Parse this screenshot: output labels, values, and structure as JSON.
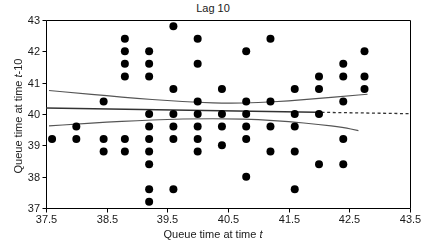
{
  "chart_data": {
    "type": "scatter",
    "title": "Lag 10",
    "xlabel": "Queue time at time t",
    "ylabel": "Queue time at time t-10",
    "xlabel_plain": "Queue time at time ",
    "xlabel_italic": "t",
    "ylabel_plain": "Queue time at time ",
    "ylabel_italic": "t",
    "ylabel_suffix": "-10",
    "xlim": [
      37.5,
      43.5
    ],
    "ylim": [
      37,
      43
    ],
    "xticks": [
      37.5,
      38.5,
      39.5,
      40.5,
      41.5,
      42.5,
      43.5
    ],
    "xticklabels": [
      "37.5",
      "38.5",
      "39.5",
      "40.5",
      "41.5",
      "42.5",
      "43.5"
    ],
    "yticks": [
      37,
      38,
      39,
      40,
      41,
      42,
      43
    ],
    "yticklabels": [
      "37",
      "38",
      "39",
      "40",
      "41",
      "42",
      "43"
    ],
    "grid": false,
    "legend": null,
    "marker": "filled-circle",
    "marker_color": "#000000",
    "marker_size": 4.0,
    "points": [
      [
        37.6,
        39.2
      ],
      [
        38.0,
        39.6
      ],
      [
        38.0,
        39.2
      ],
      [
        38.45,
        40.4
      ],
      [
        38.45,
        39.2
      ],
      [
        38.45,
        38.8
      ],
      [
        38.8,
        42.4
      ],
      [
        38.8,
        42.0
      ],
      [
        38.8,
        41.6
      ],
      [
        38.8,
        41.2
      ],
      [
        38.8,
        39.2
      ],
      [
        38.8,
        38.8
      ],
      [
        39.2,
        42.0
      ],
      [
        39.2,
        41.6
      ],
      [
        39.2,
        41.2
      ],
      [
        39.2,
        40.0
      ],
      [
        39.2,
        39.6
      ],
      [
        39.2,
        39.2
      ],
      [
        39.2,
        38.8
      ],
      [
        39.2,
        38.4
      ],
      [
        39.2,
        37.6
      ],
      [
        39.2,
        37.2
      ],
      [
        39.6,
        42.8
      ],
      [
        39.6,
        40.8
      ],
      [
        39.6,
        40.0
      ],
      [
        39.6,
        39.6
      ],
      [
        39.6,
        39.2
      ],
      [
        39.6,
        37.6
      ],
      [
        40.0,
        42.4
      ],
      [
        40.0,
        41.6
      ],
      [
        40.0,
        40.4
      ],
      [
        40.0,
        40.0
      ],
      [
        40.0,
        39.6
      ],
      [
        40.0,
        39.2
      ],
      [
        40.0,
        38.8
      ],
      [
        40.4,
        40.8
      ],
      [
        40.4,
        40.0
      ],
      [
        40.4,
        39.6
      ],
      [
        40.4,
        39.0
      ],
      [
        40.8,
        42.0
      ],
      [
        40.8,
        40.4
      ],
      [
        40.8,
        40.0
      ],
      [
        40.8,
        39.6
      ],
      [
        40.8,
        39.2
      ],
      [
        40.8,
        38.0
      ],
      [
        41.2,
        42.4
      ],
      [
        41.2,
        40.4
      ],
      [
        41.2,
        39.6
      ],
      [
        41.2,
        38.8
      ],
      [
        41.6,
        40.8
      ],
      [
        41.6,
        40.0
      ],
      [
        41.6,
        39.6
      ],
      [
        41.6,
        38.8
      ],
      [
        41.6,
        37.6
      ],
      [
        42.0,
        41.2
      ],
      [
        42.0,
        40.8
      ],
      [
        42.0,
        40.0
      ],
      [
        42.0,
        38.4
      ],
      [
        42.4,
        41.6
      ],
      [
        42.4,
        41.2
      ],
      [
        42.4,
        40.4
      ],
      [
        42.4,
        39.2
      ],
      [
        42.4,
        38.4
      ],
      [
        42.75,
        42.0
      ],
      [
        42.75,
        41.2
      ],
      [
        42.75,
        40.8
      ]
    ],
    "fit_line": {
      "name": "regression-fit",
      "color": "#333333",
      "style": "solid-then-dashed",
      "dash_start_x": 41.95,
      "points": [
        [
          37.5,
          40.19
        ],
        [
          38.5,
          40.16
        ],
        [
          39.5,
          40.13
        ],
        [
          40.5,
          40.1
        ],
        [
          41.5,
          40.07
        ],
        [
          42.5,
          40.04
        ],
        [
          43.5,
          40.01
        ]
      ]
    },
    "confidence_bands": [
      {
        "name": "upper-confidence-band",
        "color": "#555555",
        "style": "solid",
        "points": [
          [
            37.55,
            40.75
          ],
          [
            38.0,
            40.67
          ],
          [
            38.5,
            40.58
          ],
          [
            39.0,
            40.5
          ],
          [
            39.5,
            40.43
          ],
          [
            40.0,
            40.37
          ],
          [
            40.5,
            40.34
          ],
          [
            41.0,
            40.36
          ],
          [
            41.5,
            40.42
          ],
          [
            42.0,
            40.5
          ],
          [
            42.5,
            40.58
          ],
          [
            42.8,
            40.63
          ]
        ]
      },
      {
        "name": "lower-confidence-band",
        "color": "#555555",
        "style": "solid",
        "points": [
          [
            37.55,
            39.62
          ],
          [
            38.0,
            39.68
          ],
          [
            38.5,
            39.74
          ],
          [
            39.0,
            39.79
          ],
          [
            39.5,
            39.83
          ],
          [
            40.0,
            39.85
          ],
          [
            40.5,
            39.85
          ],
          [
            41.0,
            39.82
          ],
          [
            41.5,
            39.76
          ],
          [
            42.0,
            39.67
          ],
          [
            42.4,
            39.57
          ],
          [
            42.65,
            39.47
          ]
        ]
      }
    ]
  }
}
